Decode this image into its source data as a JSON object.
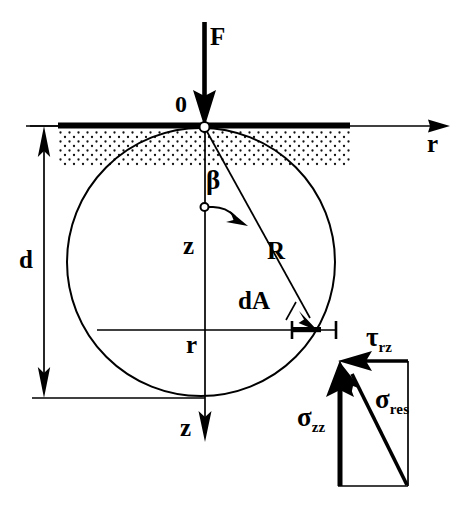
{
  "figure": {
    "background_color": "#ffffff",
    "stroke_color": "#000000",
    "width": 466,
    "height": 506
  },
  "labels": {
    "force": "F",
    "origin": "0",
    "r_axis": "r",
    "beta": "β",
    "depth": "d",
    "z_mid": "z",
    "radius": "R",
    "area_element": "dA",
    "r_dim": "r",
    "z_bottom": "z",
    "tau_base": "τ",
    "tau_sub": "rz",
    "sigma_res_base": "σ",
    "sigma_res_sub": "res",
    "sigma_zz_base": "σ",
    "sigma_zz_sub": "zz"
  },
  "geometry": {
    "surface_line_y": 126,
    "origin_point": {
      "x": 204,
      "y": 127
    },
    "circle": {
      "cx": 201,
      "cy": 262,
      "r": 134
    },
    "circle_center_marker": {
      "x": 204,
      "y": 207
    },
    "depth_dimension": {
      "x": 44,
      "y_top": 128,
      "y_bottom": 396
    },
    "r_dimension_line_y": 330,
    "z_axis_tip": {
      "x": 205,
      "y": 442
    },
    "r_axis_tip": {
      "x": 450,
      "y": 126
    },
    "stress_triangle": {
      "left_x": 338,
      "right_x": 408,
      "top_y": 361,
      "bottom_y": 486
    },
    "hatch_band": {
      "y_top": 130,
      "y_bottom": 166,
      "x_left": 58,
      "x_right": 350
    }
  }
}
